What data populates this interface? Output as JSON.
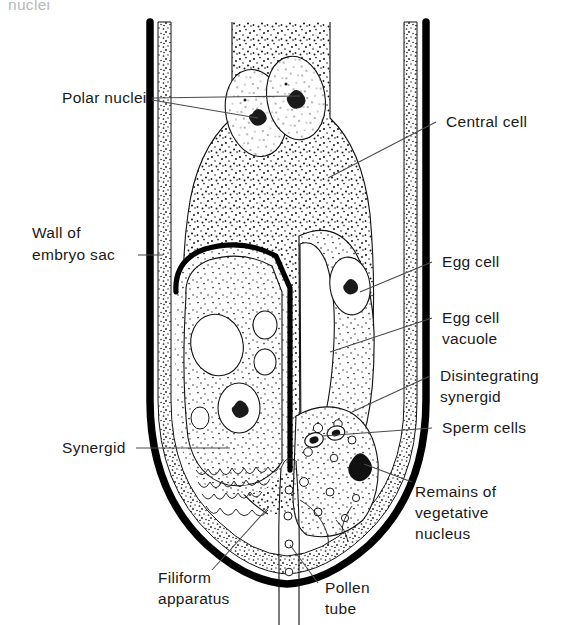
{
  "figure": {
    "kind": "botanical-line-diagram",
    "cut_off_caption_top": "nuclei",
    "background_color": "#ffffff",
    "ink_color": "#111111",
    "leader_color": "#4a4a4a"
  },
  "labels": {
    "polar_nuclei": "Polar nuclei",
    "central_cell": "Central cell",
    "wall_of_embryo_sac_line1": "Wall of",
    "wall_of_embryo_sac_line2": "embryo sac",
    "egg_cell": "Egg cell",
    "egg_cell_vacuole_line1": "Egg cell",
    "egg_cell_vacuole_line2": "vacuole",
    "disintegrating_synergid_line1": "Disintegrating",
    "disintegrating_synergid_line2": "synergid",
    "sperm_cells": "Sperm cells",
    "synergid": "Synergid",
    "remains_line1": "Remains of",
    "remains_line2": "vegetative",
    "remains_line3": "nucleus",
    "filiform_apparatus_line1": "Filiform",
    "filiform_apparatus_line2": "apparatus",
    "pollen_tube_line1": "Pollen",
    "pollen_tube_line2": "tube"
  },
  "structures": [
    {
      "name": "embryo-sac-wall",
      "description": "thick black outer wall with stippled inner band"
    },
    {
      "name": "central-cell",
      "description": "large stippled cell occupying upper embryo sac"
    },
    {
      "name": "polar-nuclei",
      "count": 2
    },
    {
      "name": "egg-cell",
      "description": "pear-shaped cell with nucleus and large vacuole"
    },
    {
      "name": "persistent-synergid",
      "description": "left cell with heavy wall, nucleus and vacuoles"
    },
    {
      "name": "disintegrating-synergid",
      "description": "right lower cell receiving pollen tube contents"
    },
    {
      "name": "sperm-cells",
      "count": 2
    },
    {
      "name": "vegetative-nucleus-remains",
      "count": 1
    },
    {
      "name": "filiform-apparatus",
      "description": "crenulated wall thickenings at micropylar end"
    },
    {
      "name": "pollen-tube",
      "description": "narrow tube entering through micropyle"
    }
  ]
}
